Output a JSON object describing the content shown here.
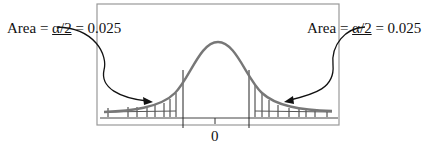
{
  "diagram": {
    "left_label": {
      "prefix": "Area = ",
      "alpha": "α/2",
      "suffix": " = 0.025"
    },
    "right_label": {
      "prefix": "Area = ",
      "alpha": "α/2",
      "suffix": " = 0.025"
    },
    "center_tick_label": "0",
    "colors": {
      "curve": "#777777",
      "frame": "#999999",
      "ink": "#111111"
    }
  }
}
